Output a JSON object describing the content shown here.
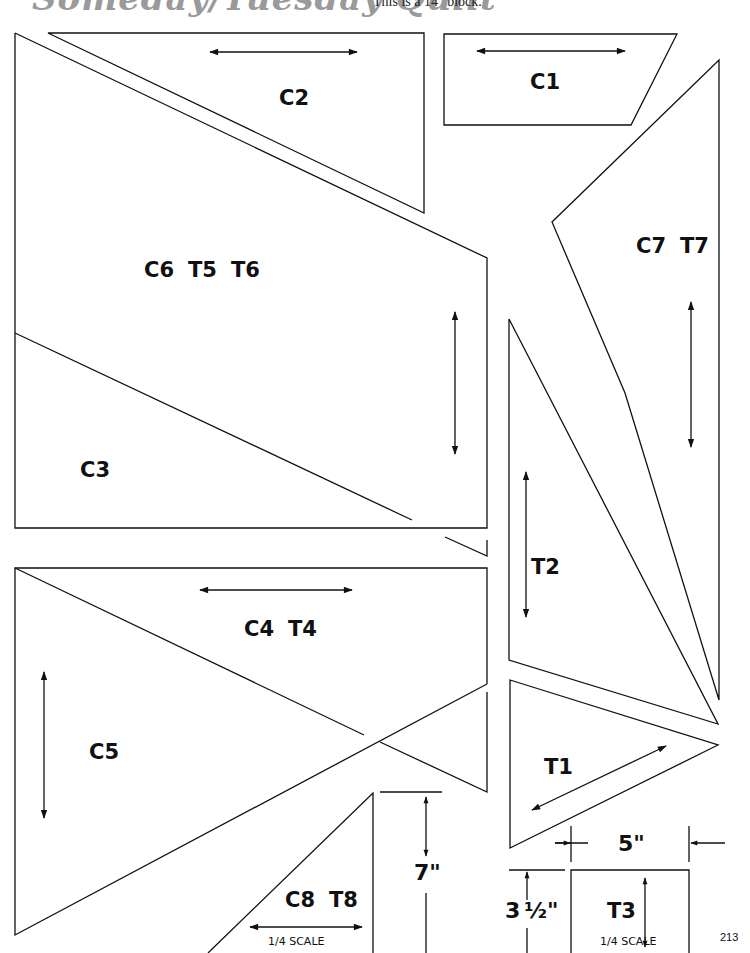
{
  "header": {
    "title": "Someday/Tuesday Quilt",
    "note": "This is a 14\" block."
  },
  "pieces": {
    "c1": "C1",
    "c2": "C2",
    "c3": "C3",
    "c6t5t6": [
      "C6",
      "T5",
      "T6"
    ],
    "c7t7": [
      "C7",
      "T7"
    ],
    "t2": "T2",
    "c4t4": [
      "C4",
      "T4"
    ],
    "c5": "C5",
    "t1": "T1",
    "c8t8": [
      "C8",
      "T8"
    ],
    "t3": "T3"
  },
  "dimensions": {
    "height_c8": "7\"",
    "width_t3": "5\"",
    "height_t3_whole": "3",
    "height_t3_frac": "½\""
  },
  "scale_notes": {
    "c8": "1/4 SCALE",
    "t3": "1/4 SCALE"
  },
  "footer": {
    "page_number": "213"
  },
  "colors": {
    "line": "#111111",
    "header_script": "#9a9a9a"
  }
}
